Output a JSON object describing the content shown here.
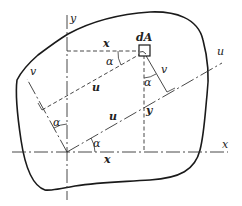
{
  "diagram": {
    "type": "rotated-axes-area-element",
    "colors": {
      "stroke": "#1a1a1a",
      "background": "#ffffff",
      "text": "#222222"
    },
    "axes": {
      "x": {
        "label": "x"
      },
      "y": {
        "label": "y"
      },
      "u": {
        "label": "u"
      },
      "v": {
        "label": "v"
      }
    },
    "element": {
      "label": "dA"
    },
    "dimensions": {
      "x_top": "x",
      "x_bottom": "x",
      "y_right": "y",
      "u_top": "u",
      "u_bottom": "u",
      "v_right": "v"
    },
    "angles": {
      "alpha_top": "α",
      "alpha_right": "α",
      "alpha_left": "α",
      "alpha_origin": "α"
    }
  }
}
